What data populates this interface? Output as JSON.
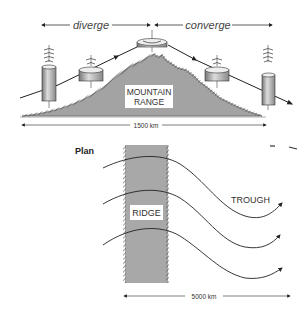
{
  "profile_view": {
    "diverge_label": "diverge",
    "converge_label": "converge",
    "mountain_label_line1": "MOUNTAIN",
    "mountain_label_line2": "RANGE",
    "scale_label": "1500 km"
  },
  "plan_view": {
    "title": "Plan",
    "ridge_label": "RIDGE",
    "trough_label": "TROUGH",
    "scale_label": "5000 km",
    "flow_line_count": 3
  },
  "colors": {
    "mountain_fill": "#a3a3a3",
    "ridge_fill": "#a8a8a8",
    "line": "#222222",
    "background": "#ffffff"
  }
}
